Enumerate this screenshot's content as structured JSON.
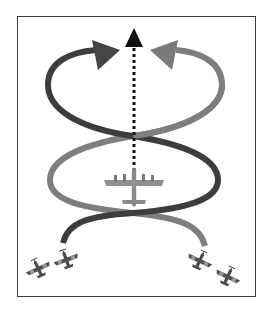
{
  "diagram": {
    "description": "Two fighter pairs weave in a crossing double-loop pattern around a four-engine bomber flying straight ahead",
    "colors": {
      "frame": "#3c3c3c",
      "dark_path": "#3d3d3d",
      "light_path": "#7e7e7e",
      "center_arrow": "#111111",
      "bomber": "#8a8a8a",
      "fighter": "#4a4a4a",
      "background": "#ffffff"
    },
    "elements": {
      "bomber": "four-engine bomber, top view, heading up",
      "center_arrow": "dotted straight path forward",
      "dark_path": "left fighter pair weave path",
      "light_path": "right fighter pair weave path",
      "fighters_left": "two fighters lower-left",
      "fighters_right": "two fighters lower-right"
    }
  }
}
